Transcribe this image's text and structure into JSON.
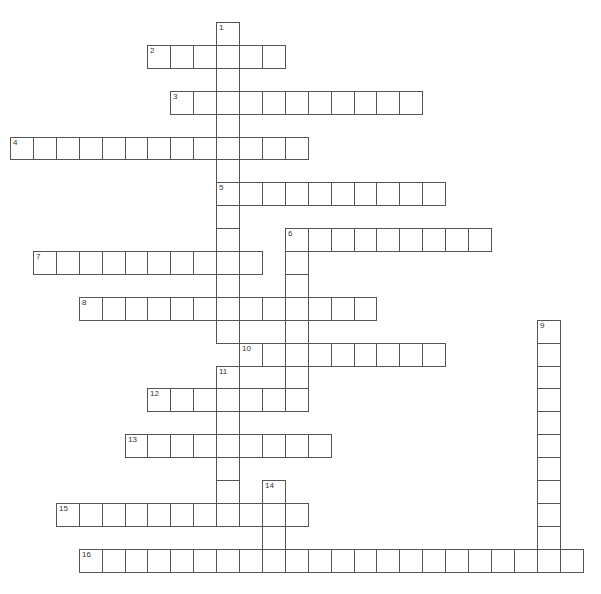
{
  "puzzle": {
    "cell_size": 22.9,
    "origin_x": 10,
    "origin_y": 22,
    "line_color": "#555555",
    "words": [
      {
        "number": "1",
        "direction": "down",
        "col": 9,
        "row": 0,
        "length": 14
      },
      {
        "number": "2",
        "direction": "across",
        "col": 6,
        "row": 1,
        "length": 6
      },
      {
        "number": "3",
        "direction": "across",
        "col": 7,
        "row": 3,
        "length": 11
      },
      {
        "number": "4",
        "direction": "across",
        "col": 0,
        "row": 5,
        "length": 13
      },
      {
        "number": "5",
        "direction": "across",
        "col": 9,
        "row": 7,
        "length": 10
      },
      {
        "number": "6",
        "direction": "across",
        "col": 12,
        "row": 9,
        "length": 9
      },
      {
        "number": "6",
        "direction": "down",
        "col": 12,
        "row": 9,
        "length": 8
      },
      {
        "number": "7",
        "direction": "across",
        "col": 1,
        "row": 10,
        "length": 10
      },
      {
        "number": "8",
        "direction": "across",
        "col": 3,
        "row": 12,
        "length": 13
      },
      {
        "number": "9",
        "direction": "down",
        "col": 23,
        "row": 13,
        "length": 11
      },
      {
        "number": "10",
        "direction": "across",
        "col": 10,
        "row": 14,
        "length": 9
      },
      {
        "number": "11",
        "direction": "down",
        "col": 9,
        "row": 15,
        "length": 7
      },
      {
        "number": "12",
        "direction": "across",
        "col": 6,
        "row": 16,
        "length": 7
      },
      {
        "number": "13",
        "direction": "across",
        "col": 5,
        "row": 18,
        "length": 9
      },
      {
        "number": "14",
        "direction": "down",
        "col": 11,
        "row": 20,
        "length": 4
      },
      {
        "number": "15",
        "direction": "across",
        "col": 2,
        "row": 21,
        "length": 11
      },
      {
        "number": "16",
        "direction": "across",
        "col": 3,
        "row": 23,
        "length": 22
      }
    ]
  }
}
